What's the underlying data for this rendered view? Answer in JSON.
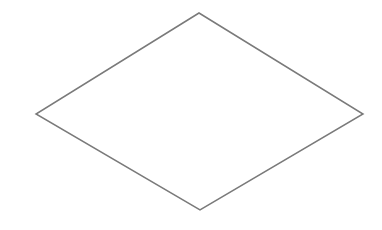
{
  "canvas": {
    "width": 382,
    "height": 230,
    "background_color": "#ffffff"
  },
  "figure": {
    "name": "rhombus",
    "shape_type": "polygon",
    "sides": 4,
    "stroke_color": "#7a7a7a",
    "stroke_width": 1.5,
    "fill_color": "#ffffff",
    "vertices": [
      {
        "label": "top",
        "x": 199,
        "y": 13
      },
      {
        "label": "right",
        "x": 363,
        "y": 114
      },
      {
        "label": "bottom",
        "x": 200,
        "y": 210
      },
      {
        "label": "left",
        "x": 36,
        "y": 114
      }
    ],
    "points_attr": "199,13 363,114 200,210 36,114",
    "bounding_box": {
      "x": 36,
      "y": 13,
      "width": 327,
      "height": 197
    },
    "horizontal_diagonal": 327,
    "vertical_diagonal": 197
  }
}
